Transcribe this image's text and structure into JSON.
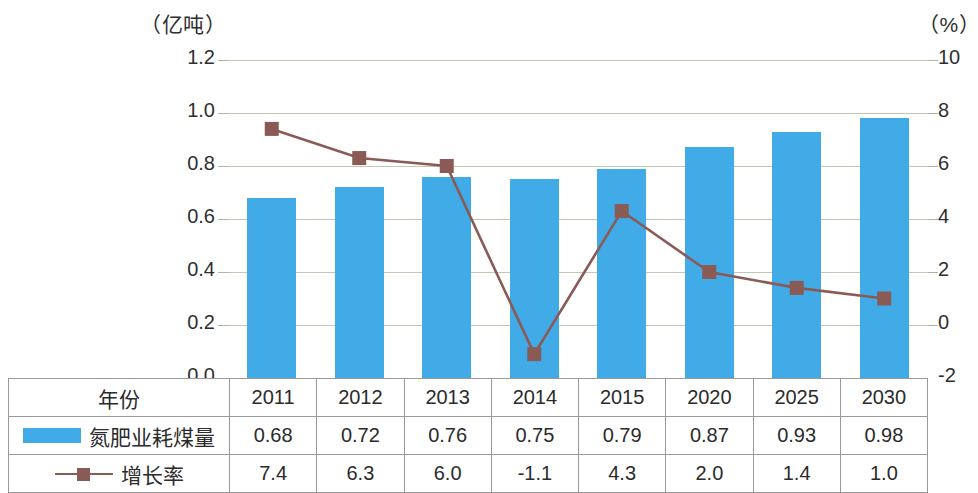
{
  "axes": {
    "left_caption": "（亿吨）",
    "right_caption": "（%）",
    "left_ticks": [
      "1.2",
      "1.0",
      "0.8",
      "0.6",
      "0.4",
      "0.2",
      "0.0"
    ],
    "right_ticks": [
      "10",
      "8",
      "6",
      "4",
      "2",
      "0",
      "-2"
    ]
  },
  "table": {
    "year_row_label": "年份",
    "bar_row_label": "氮肥业耗煤量",
    "line_row_label": "增长率"
  },
  "colors": {
    "bar": "#41abe8",
    "line": "#8a5a55",
    "marker": "#8a5a55",
    "grid": "#b9bba8"
  },
  "chart_data": {
    "type": "bar",
    "title": "",
    "xlabel": "",
    "ylabel": "（亿吨）",
    "y2label": "（%）",
    "categories": [
      "2011",
      "2012",
      "2013",
      "2014",
      "2015",
      "2020",
      "2025",
      "2030"
    ],
    "ylim": [
      0.0,
      1.2
    ],
    "y2lim": [
      -2,
      10
    ],
    "grid": true,
    "legend_position": "bottom-table",
    "series": [
      {
        "name": "氮肥业耗煤量",
        "type": "bar",
        "axis": "left",
        "unit": "亿吨",
        "values": [
          0.68,
          0.72,
          0.76,
          0.75,
          0.79,
          0.87,
          0.93,
          0.98
        ]
      },
      {
        "name": "增长率",
        "type": "line",
        "axis": "right",
        "unit": "%",
        "values": [
          7.4,
          6.3,
          6.0,
          -1.1,
          4.3,
          2.0,
          1.4,
          1.0
        ]
      }
    ]
  }
}
